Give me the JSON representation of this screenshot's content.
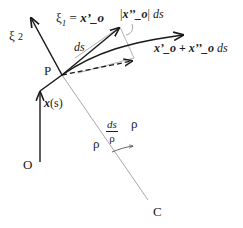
{
  "diagram": {
    "type": "vector-geometry",
    "points": {
      "origin": {
        "label": "O",
        "x": 40,
        "y": 162
      },
      "P": {
        "label": "P",
        "x": 62,
        "y": 75
      },
      "C": {
        "label": "C",
        "x": 150,
        "y": 205
      }
    },
    "labels": {
      "xi2_symbol": "ξ",
      "xi2_sub": "2",
      "xi1_symbol": "ξ",
      "xi1_sub": "1",
      "xi1_eq": " = ",
      "xi1_rhs": "x’_o",
      "P": "P",
      "O": "O",
      "C": "C",
      "position_vec": "x",
      "position_arg": "(s)",
      "ds_tangent": "ds",
      "norm_open": "|",
      "norm_vec": "x’’_o",
      "norm_close": "|",
      "norm_ds": " ds",
      "sum_a": "x’_o",
      "sum_plus": " + ",
      "sum_b": "x’’_o",
      "sum_ds": " ds",
      "rho_left": "ρ",
      "rho_right": "ρ",
      "angle_num": "ds",
      "angle_den": "ρ"
    },
    "colors": {
      "ink": "#1a1a1a",
      "construction": "#a8a8a8",
      "background": "#ffffff"
    }
  }
}
